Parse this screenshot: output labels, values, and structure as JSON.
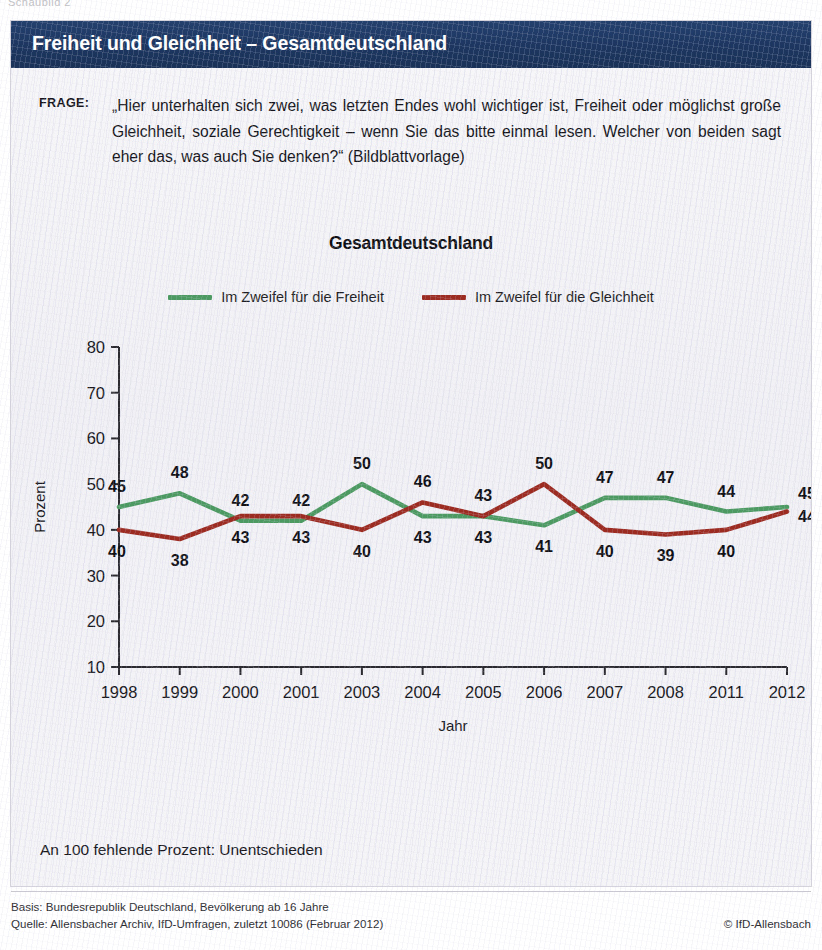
{
  "chart_number": "Schaubild 2",
  "header": {
    "title": "Freiheit und Gleichheit – Gesamtdeutschland",
    "bar_color": "#1e3a66"
  },
  "question": {
    "label": "FRAGE:",
    "text": "„Hier unterhalten sich zwei, was letzten Endes wohl wichtiger ist, Freiheit oder möglichst große Gleichheit, soziale Gerechtigkeit – wenn Sie das bitte einmal lesen. Welcher von beiden sagt eher das, was auch Sie denken?“ (Bildblattvorlage)"
  },
  "panel_note": "An 100 fehlende Prozent: Unentschieden",
  "source": {
    "basis": "Basis: Bundesrepublik Deutschland, Bevölkerung ab 16 Jahre",
    "quelle": "Quelle: Allensbacher Archiv, IfD-Umfragen, zuletzt 10086 (Februar 2012)",
    "copyright": "© IfD-Allensbach"
  },
  "chart_data": {
    "type": "line",
    "title": "Gesamtdeutschland",
    "xlabel": "Jahr",
    "ylabel": "Prozent",
    "ylim": [
      10,
      80
    ],
    "yticks": [
      10,
      20,
      30,
      40,
      50,
      60,
      70,
      80
    ],
    "grid": false,
    "legend_position": "top-center",
    "categories": [
      "1998",
      "1999",
      "2000",
      "2001",
      "2003",
      "2004",
      "2005",
      "2006",
      "2007",
      "2008",
      "2011",
      "2012"
    ],
    "series": [
      {
        "name": "Im Zweifel für die Freiheit",
        "color": "#4c9a62",
        "values": [
          45,
          48,
          42,
          42,
          50,
          43,
          43,
          41,
          47,
          47,
          44,
          45
        ],
        "label_positions": [
          "above",
          "above",
          "above",
          "above",
          "above",
          "below",
          "below",
          "below",
          "above",
          "above",
          "above",
          "above"
        ]
      },
      {
        "name": "Im Zweifel für die Gleichheit",
        "color": "#9c2b22",
        "values": [
          40,
          38,
          43,
          43,
          40,
          46,
          43,
          50,
          40,
          39,
          40,
          44
        ],
        "label_positions": [
          "below",
          "below",
          "below",
          "below",
          "below",
          "above",
          "above",
          "above",
          "below",
          "below",
          "below",
          "below"
        ]
      }
    ]
  }
}
